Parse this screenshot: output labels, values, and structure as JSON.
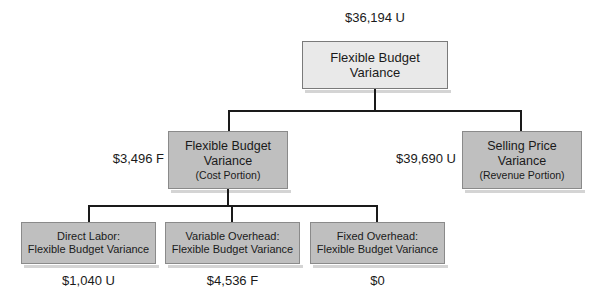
{
  "diagram": {
    "title_value": "$36,194 U",
    "nodes": {
      "root": {
        "line1": "Flexible Budget",
        "line2": "Variance",
        "value": "$36,194 U"
      },
      "cost_portion": {
        "line1": "Flexible Budget",
        "line2": "Variance",
        "line3": "(Cost Portion)",
        "value": "$3,496 F"
      },
      "revenue_portion": {
        "line1": "Selling Price",
        "line2": "Variance",
        "line3": "(Revenue Portion)",
        "value": "$39,690 U"
      },
      "direct_labor": {
        "line1": "Direct Labor:",
        "line2": "Flexible Budget Variance",
        "value": "$1,040 U"
      },
      "variable_overhead": {
        "line1": "Variable Overhead:",
        "line2": "Flexible Budget Variance",
        "value": "$4,536 F"
      },
      "fixed_overhead": {
        "line1": "Fixed Overhead:",
        "line2": "Flexible Budget Variance",
        "value": "$0"
      }
    },
    "colors": {
      "root_fill": "#e9e9e9",
      "node_fill": "#bfbfbf",
      "border": "#8a8a8a",
      "connector": "#1a1a1a",
      "text": "#1a1a1a"
    }
  }
}
